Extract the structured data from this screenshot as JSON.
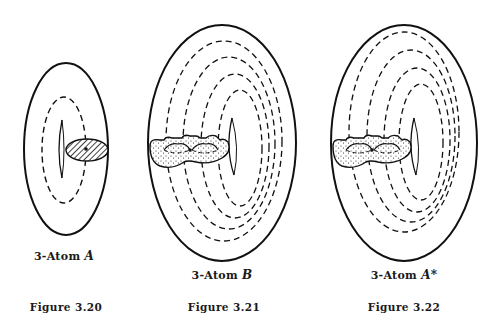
{
  "figures": [
    {
      "id": "fig-3-20",
      "label_prefix": "3-Atom ",
      "label_symbol": "A",
      "caption": "Figure 3.20",
      "shading": "hatched",
      "dashed_loops": 1
    },
    {
      "id": "fig-3-21",
      "label_prefix": "3-Atom ",
      "label_symbol": "B",
      "caption": "Figure 3.21",
      "shading": "stippled",
      "dashed_loops": 4
    },
    {
      "id": "fig-3-22",
      "label_prefix": "3-Atom ",
      "label_symbol": "A*",
      "caption": "Figure 3.22",
      "shading": "stippled",
      "dashed_loops": 4
    }
  ],
  "colors": {
    "stroke": "#111111",
    "background": "#ffffff"
  }
}
